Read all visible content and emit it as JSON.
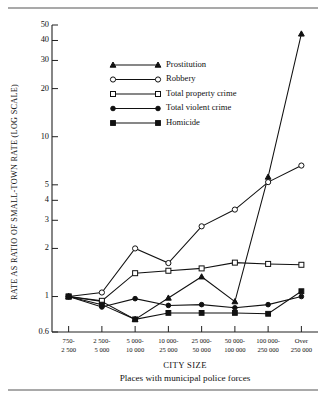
{
  "chart_data": {
    "type": "line",
    "title": "",
    "xlabel": "CITY SIZE",
    "xlabel_sub": "Places with municipal police forces",
    "ylabel": "RATE AS RATIO OF SMALL-TOWN RATE (LOG SCALE)",
    "yscale": "log",
    "ylim": [
      0.6,
      50
    ],
    "grid": false,
    "legend_position": "upper-left-inside",
    "categories": [
      "750-\n2 500",
      "2 500-\n5 000",
      "5 000-\n10 000",
      "10 000-\n25 000",
      "25 000-\n50 000",
      "50 000-\n100 000",
      "100 000-\n250 000",
      "Over\n250 000"
    ],
    "category_lines": [
      [
        "750-",
        "2 500"
      ],
      [
        "2 500-",
        "5 000"
      ],
      [
        "5 000-",
        "10 000"
      ],
      [
        "10 000-",
        "25 000"
      ],
      [
        "25 000-",
        "50 000"
      ],
      [
        "50 000-",
        "100 000"
      ],
      [
        "100 000-",
        "250 000"
      ],
      [
        "Over",
        "250 000"
      ]
    ],
    "ytick_labels": [
      "0.6",
      "1",
      "2",
      "3",
      "4",
      "5",
      "10",
      "20",
      "30",
      "40",
      "50"
    ],
    "ytick_values": [
      0.6,
      1,
      2,
      3,
      4,
      5,
      10,
      20,
      30,
      40,
      50
    ],
    "series": [
      {
        "name": "Prostitution",
        "marker": "triangle-solid",
        "values": [
          1.0,
          0.93,
          0.72,
          0.98,
          1.33,
          0.93,
          5.6,
          44.0
        ]
      },
      {
        "name": "Robbery",
        "marker": "circle-open",
        "values": [
          1.0,
          1.06,
          2.0,
          1.62,
          2.75,
          3.5,
          5.2,
          6.6
        ]
      },
      {
        "name": "Total property crime",
        "marker": "square-open",
        "values": [
          1.0,
          0.94,
          1.4,
          1.45,
          1.5,
          1.63,
          1.6,
          1.58
        ]
      },
      {
        "name": "Total violent crime",
        "marker": "circle-solid",
        "values": [
          1.0,
          0.86,
          0.97,
          0.88,
          0.89,
          0.85,
          0.89,
          1.0
        ]
      },
      {
        "name": "Homicide",
        "marker": "square-solid",
        "values": [
          1.0,
          0.89,
          0.72,
          0.79,
          0.79,
          0.79,
          0.78,
          1.08
        ]
      }
    ]
  },
  "legend": {
    "items": [
      {
        "label": "Prostitution",
        "marker": "triangle-solid"
      },
      {
        "label": "Robbery",
        "marker": "circle-open"
      },
      {
        "label": "Total property crime",
        "marker": "square-open"
      },
      {
        "label": "Total violent crime",
        "marker": "circle-solid"
      },
      {
        "label": "Homicide",
        "marker": "square-solid"
      }
    ]
  }
}
